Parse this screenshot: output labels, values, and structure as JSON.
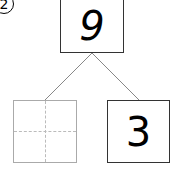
{
  "problem": {
    "number_label": "2",
    "top_value": "9",
    "left_value": "",
    "right_value": "3"
  },
  "colors": {
    "box_border": "#333333",
    "empty_box_border": "#aaaaaa",
    "guide_dashes": "#bbbbbb",
    "connector_lines": "#888888"
  }
}
